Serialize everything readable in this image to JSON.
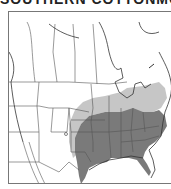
{
  "title": "SOUTHERN COTTONMOUTH",
  "map": {
    "region": "United States and southern Canada",
    "legend": [],
    "colors": {
      "range_primary": "#7a7a7a",
      "range_secondary": "#c6c6c6",
      "border": "#555555",
      "background": "#ffffff"
    },
    "shaded_regions": {
      "primary": [
        "Texas (east)",
        "Oklahoma (east)",
        "Kansas (east)",
        "Missouri",
        "Arkansas",
        "Louisiana",
        "Mississippi",
        "Alabama",
        "Tennessee",
        "Kentucky",
        "Georgia",
        "Florida",
        "South Carolina",
        "North Carolina",
        "Virginia",
        "Illinois (south)",
        "Indiana (south)"
      ],
      "secondary": [
        "Nebraska (south)",
        "Iowa",
        "Illinois (north)",
        "Indiana (north)",
        "Ohio",
        "Michigan (south)",
        "Pennsylvania",
        "Wisconsin (south)",
        "Kansas (west)",
        "Texas (central)"
      ]
    }
  }
}
